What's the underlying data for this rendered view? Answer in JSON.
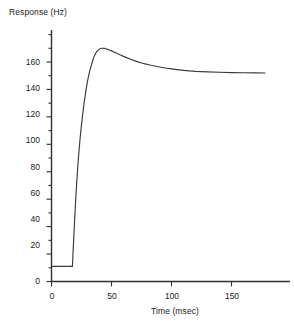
{
  "chart_data": {
    "type": "line",
    "title": "",
    "subtitle": "",
    "xlabel": "Time (msec)",
    "ylabel": "Response (Hz)",
    "xlim": [
      -4,
      184
    ],
    "ylim": [
      -2,
      188
    ],
    "xticks": [
      0,
      50,
      100,
      150
    ],
    "yticks": [
      0,
      20,
      40,
      60,
      80,
      100,
      120,
      140,
      160
    ],
    "xtick_labels": [
      "0",
      "50",
      "100",
      "150"
    ],
    "ytick_labels": [
      "0",
      "20",
      "40",
      "60",
      "80",
      "100",
      "120",
      "140",
      "160"
    ],
    "grid": false,
    "legend": null,
    "legend_position": "none",
    "line_color": "#3a3a3a",
    "axis_color": "#303030",
    "background_color": "#ffffff",
    "annotations": [],
    "series": [
      {
        "name": "Response",
        "baseline_value": 11,
        "step_onset_time": 17.5,
        "peak_value": 170,
        "peak_time": 46,
        "steady_state_value": 152,
        "x": [
          0,
          2,
          4,
          6,
          8,
          10,
          12,
          14,
          16,
          17.4,
          17.6,
          18,
          19,
          20,
          21,
          22,
          23,
          24,
          25,
          26,
          27,
          28,
          29,
          30,
          31,
          32,
          33,
          34,
          35,
          36,
          37,
          38,
          39,
          40,
          41,
          42,
          43,
          44,
          45,
          46,
          47,
          48,
          50,
          52,
          54,
          56,
          58,
          60,
          63,
          66,
          69,
          72,
          75,
          78,
          82,
          86,
          90,
          95,
          100,
          105,
          110,
          115,
          120,
          125,
          130,
          140,
          150,
          160,
          170,
          178
        ],
        "y": [
          11,
          11,
          11,
          11,
          11,
          11,
          11,
          11,
          11,
          11,
          14,
          22,
          40,
          57,
          72,
          85,
          96,
          106,
          114,
          122,
          129,
          135,
          141,
          146,
          150,
          154,
          157,
          160,
          163,
          165,
          166.6,
          167.9,
          168.8,
          169.4,
          169.8,
          170,
          170,
          169.9,
          169.7,
          169.5,
          169.2,
          168.8,
          168.1,
          167.3,
          166.5,
          165.7,
          164.9,
          164.1,
          163,
          162,
          161,
          160.1,
          159.3,
          158.6,
          157.8,
          157.1,
          156.4,
          155.6,
          155,
          154.4,
          153.9,
          153.5,
          153.2,
          153,
          152.8,
          152.5,
          152.3,
          152.2,
          152.1,
          152
        ]
      }
    ]
  },
  "axes": {
    "y_tick_labels": [
      "160",
      "140",
      "120",
      "100",
      "80",
      "60",
      "40",
      "20",
      "0"
    ],
    "x_tick_labels": [
      "0",
      "50",
      "100",
      "150"
    ],
    "ylabel": "Response (Hz)",
    "xlabel": "Time (msec)"
  }
}
